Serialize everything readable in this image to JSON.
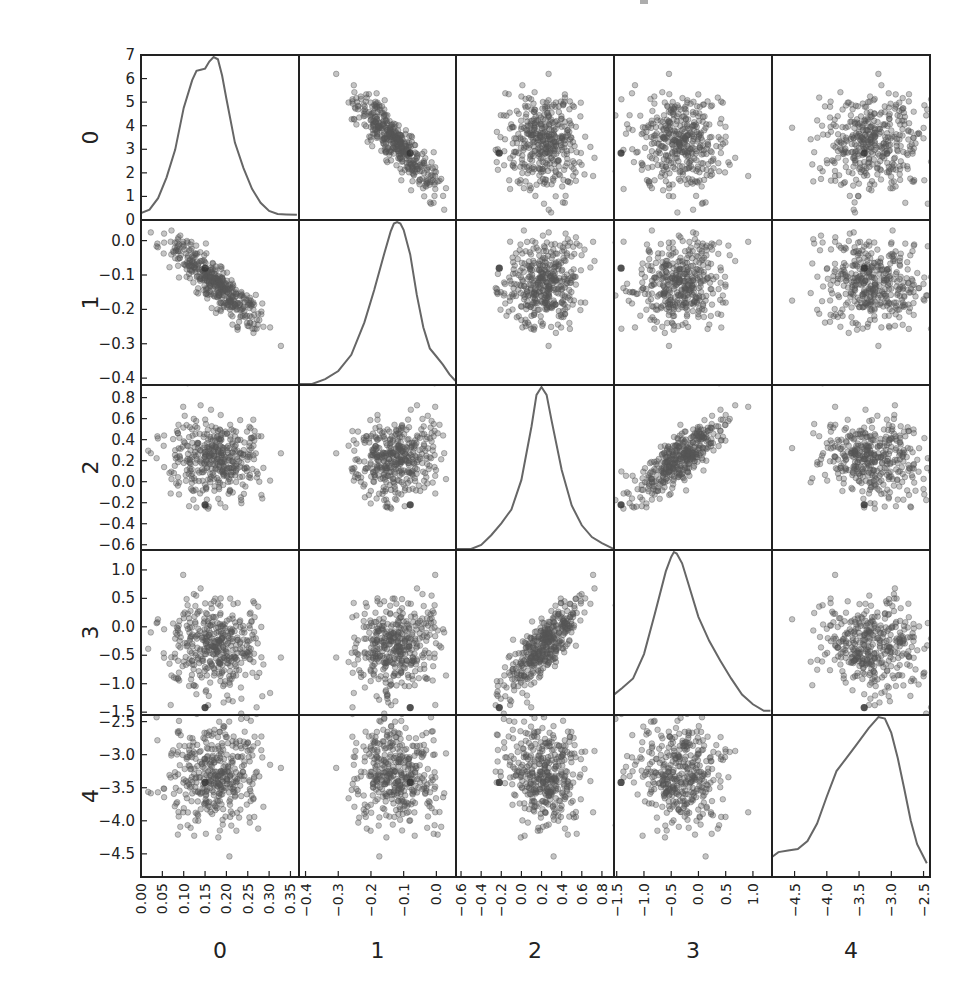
{
  "figure": {
    "type": "scatter_matrix",
    "title_fragment_visible": true,
    "width": 966,
    "height": 1004,
    "panel_x_edges": [
      141,
      299,
      456,
      614,
      772,
      930
    ],
    "panel_y_edges": [
      55,
      220,
      385,
      550,
      715,
      877
    ],
    "point_color": "#555555",
    "point_alpha": 0.35,
    "curve_color": "#666666",
    "frame_color": "#222222",
    "label_color": "#222222"
  },
  "chart_data": {
    "type": "scatter",
    "subtype": "scatter_matrix_with_kde_diagonal",
    "title": "",
    "variables": [
      "0",
      "1",
      "2",
      "3",
      "4"
    ],
    "n_points_approx": 400,
    "grid": false,
    "legend": null,
    "axes": [
      {
        "name": "0",
        "range": [
          0.0,
          0.37
        ],
        "ticks": [
          0.0,
          0.05,
          0.1,
          0.15,
          0.2,
          0.25,
          0.3,
          0.35
        ],
        "tick_labels": [
          "0.00",
          "0.05",
          "0.10",
          "0.15",
          "0.20",
          "0.25",
          "0.30",
          "0.35"
        ],
        "mean": 0.175,
        "sd": 0.055
      },
      {
        "name": "1",
        "range": [
          -0.42,
          0.06
        ],
        "ticks": [
          -0.4,
          -0.3,
          -0.2,
          -0.1,
          0.0
        ],
        "tick_labels": [
          "−0.4",
          "−0.3",
          "−0.2",
          "−0.1",
          "0.0"
        ],
        "mean": -0.125,
        "sd": 0.065
      },
      {
        "name": "2",
        "range": [
          -0.65,
          0.92
        ],
        "ticks": [
          -0.6,
          -0.4,
          -0.2,
          0.0,
          0.2,
          0.4,
          0.6,
          0.8
        ],
        "tick_labels": [
          "−0.6",
          "−0.4",
          "−0.2",
          "0.0",
          "0.2",
          "0.4",
          "0.6",
          "0.8"
        ],
        "mean": 0.22,
        "sd": 0.2
      },
      {
        "name": "3",
        "range": [
          -1.55,
          1.35
        ],
        "ticks": [
          -1.5,
          -1.0,
          -0.5,
          0.0,
          0.5,
          1.0
        ],
        "tick_labels": [
          "−1.5",
          "−1.0",
          "−0.5",
          "0.0",
          "0.5",
          "1.0"
        ],
        "mean": -0.35,
        "sd": 0.42
      },
      {
        "name": "4",
        "range": [
          -4.85,
          -2.4
        ],
        "ticks": [
          -4.5,
          -4.0,
          -3.5,
          -3.0,
          -2.5
        ],
        "tick_labels": [
          "−4.5",
          "−4.0",
          "−3.5",
          "−3.0",
          "−2.5"
        ],
        "mean": -3.3,
        "sd": 0.42
      }
    ],
    "diag_density_axis": {
      "var": "0",
      "range": [
        0,
        7
      ],
      "ticks": [
        0,
        1,
        2,
        3,
        4,
        5,
        6,
        7
      ],
      "tick_labels": [
        "0",
        "1",
        "2",
        "3",
        "4",
        "5",
        "6",
        "7"
      ]
    },
    "correlations": [
      [
        1.0,
        -0.88,
        0.0,
        -0.05,
        0.05
      ],
      [
        -0.88,
        1.0,
        0.05,
        0.05,
        -0.05
      ],
      [
        0.0,
        0.05,
        1.0,
        0.85,
        -0.2
      ],
      [
        -0.05,
        0.05,
        0.85,
        1.0,
        -0.15
      ],
      [
        0.05,
        -0.05,
        -0.2,
        -0.15,
        1.0
      ]
    ],
    "highlight_point": [
      0.15,
      -0.08,
      -0.22,
      -1.42,
      -3.42
    ],
    "kde_curves": [
      {
        "var": "0",
        "x": [
          0.0,
          0.02,
          0.04,
          0.06,
          0.08,
          0.1,
          0.12,
          0.13,
          0.14,
          0.15,
          0.16,
          0.17,
          0.18,
          0.19,
          0.2,
          0.22,
          0.24,
          0.26,
          0.28,
          0.3,
          0.32,
          0.34,
          0.365
        ],
        "y": [
          0.25,
          0.4,
          0.9,
          1.8,
          3.0,
          4.8,
          6.0,
          6.4,
          6.45,
          6.5,
          6.8,
          7.0,
          6.9,
          6.2,
          5.2,
          3.3,
          2.2,
          1.3,
          0.7,
          0.35,
          0.22,
          0.2,
          0.18
        ]
      },
      {
        "var": "1",
        "x": [
          -0.42,
          -0.38,
          -0.34,
          -0.3,
          -0.26,
          -0.22,
          -0.19,
          -0.16,
          -0.14,
          -0.13,
          -0.12,
          -0.11,
          -0.1,
          -0.08,
          -0.06,
          -0.04,
          -0.02,
          0.0,
          0.02,
          0.04,
          0.058
        ],
        "y": [
          0.0,
          0.0,
          0.03,
          0.08,
          0.18,
          0.38,
          0.58,
          0.8,
          0.94,
          0.99,
          1.0,
          0.99,
          0.95,
          0.8,
          0.55,
          0.35,
          0.22,
          0.17,
          0.12,
          0.06,
          0.02
        ]
      },
      {
        "var": "2",
        "x": [
          -0.65,
          -0.5,
          -0.4,
          -0.3,
          -0.2,
          -0.1,
          0.0,
          0.1,
          0.15,
          0.2,
          0.25,
          0.3,
          0.4,
          0.5,
          0.6,
          0.7,
          0.8,
          0.92
        ],
        "y": [
          0.0,
          0.0,
          0.02,
          0.07,
          0.13,
          0.2,
          0.35,
          0.62,
          0.78,
          0.82,
          0.78,
          0.65,
          0.4,
          0.22,
          0.12,
          0.06,
          0.03,
          0.0
        ]
      },
      {
        "var": "3",
        "x": [
          -1.55,
          -1.4,
          -1.2,
          -1.0,
          -0.8,
          -0.6,
          -0.5,
          -0.45,
          -0.4,
          -0.3,
          -0.2,
          0.0,
          0.2,
          0.4,
          0.6,
          0.8,
          1.0,
          1.2,
          1.32
        ],
        "y": [
          0.12,
          0.16,
          0.22,
          0.37,
          0.62,
          0.88,
          0.97,
          1.0,
          0.99,
          0.93,
          0.82,
          0.6,
          0.45,
          0.33,
          0.22,
          0.12,
          0.06,
          0.02,
          0.02
        ]
      },
      {
        "var": "4",
        "x": [
          -4.85,
          -4.75,
          -4.6,
          -4.45,
          -4.3,
          -4.15,
          -4.0,
          -3.85,
          -3.7,
          -3.55,
          -3.35,
          -3.2,
          -3.1,
          -3.0,
          -2.9,
          -2.8,
          -2.7,
          -2.6,
          -2.45
        ],
        "y": [
          0.12,
          0.15,
          0.16,
          0.17,
          0.22,
          0.33,
          0.5,
          0.66,
          0.74,
          0.82,
          0.93,
          1.0,
          0.99,
          0.9,
          0.74,
          0.55,
          0.35,
          0.2,
          0.08
        ]
      }
    ]
  }
}
